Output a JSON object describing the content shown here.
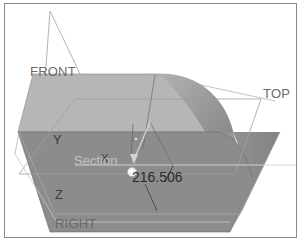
{
  "viewport": {
    "background": "#ffffff",
    "border_color": "#8a8a8a"
  },
  "datum_planes": {
    "front": "FRONT",
    "top": "TOP",
    "right": "RIGHT"
  },
  "axes": {
    "x": "X",
    "y": "Y",
    "z": "Z"
  },
  "section": {
    "label": "Section"
  },
  "dimension": {
    "value": "216.506"
  },
  "colors": {
    "top_face": "#b4b4b4",
    "front_face": "#8e8e8e",
    "side_face": "#7c7c7c",
    "datum_line": "#9a9a9a",
    "edge": "#5a5a5a"
  }
}
